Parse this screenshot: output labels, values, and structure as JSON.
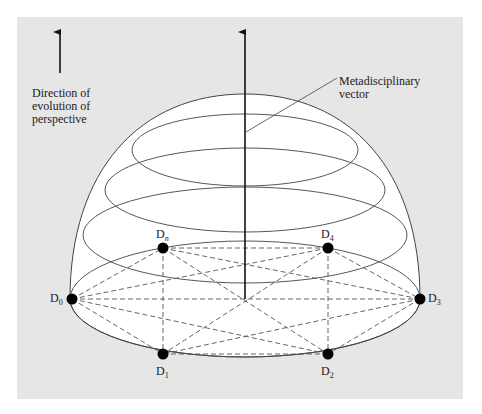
{
  "diagram": {
    "title": "",
    "direction_label": [
      "Direction of",
      "evolution of",
      "perspective"
    ],
    "vector_label": [
      "Metadisciplinary",
      "vector"
    ],
    "nodes": [
      {
        "id": "D0",
        "base": "D",
        "sub": "0"
      },
      {
        "id": "Dn",
        "base": "D",
        "sub": "n"
      },
      {
        "id": "D4",
        "base": "D",
        "sub": "4"
      },
      {
        "id": "D3",
        "base": "D",
        "sub": "3"
      },
      {
        "id": "D2",
        "base": "D",
        "sub": "2"
      },
      {
        "id": "D1",
        "base": "D",
        "sub": "1"
      }
    ],
    "colors": {
      "panel": "#e6e6e6",
      "dome": "#ffffff",
      "line": "#333333",
      "node": "#000000"
    }
  }
}
